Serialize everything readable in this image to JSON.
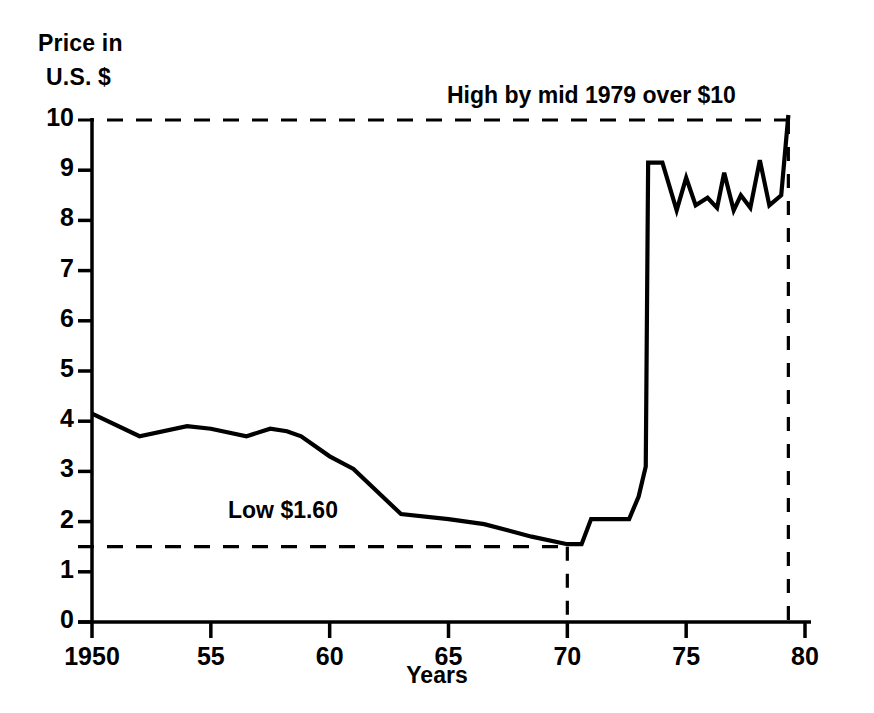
{
  "chart_data": {
    "type": "line",
    "title": "",
    "subtitle": "",
    "xlabel": "Years",
    "ylabel": "Price in U.S. $",
    "ylabel_lines": [
      "Price in",
      "U.S. $"
    ],
    "xlim": [
      1950,
      1980
    ],
    "ylim": [
      0,
      10
    ],
    "grid": false,
    "legend": null,
    "y_ticks": [
      10,
      9,
      8,
      7,
      6,
      5,
      4,
      3,
      2,
      1,
      0
    ],
    "y_tick_labels": [
      "10",
      "9",
      "8",
      "7",
      "6",
      "5",
      "4",
      "3",
      "2",
      "1",
      "0"
    ],
    "x_ticks": [
      1950,
      1955,
      1960,
      1965,
      1970,
      1975,
      1980
    ],
    "x_tick_labels": [
      "1950",
      "55",
      "60",
      "65",
      "70",
      "75",
      "80"
    ],
    "series": [
      {
        "name": "Price in U.S. $",
        "x": [
          1950.0,
          1952.0,
          1954.0,
          1955.0,
          1956.5,
          1957.5,
          1958.2,
          1958.8,
          1960.0,
          1961.0,
          1963.0,
          1965.0,
          1966.5,
          1968.5,
          1970.0,
          1970.6,
          1971.0,
          1972.6,
          1973.0,
          1973.3,
          1973.4,
          1974.0,
          1974.6,
          1975.0,
          1975.4,
          1975.9,
          1976.3,
          1976.6,
          1977.0,
          1977.3,
          1977.7,
          1978.1,
          1978.5,
          1979.0,
          1979.3
        ],
        "y": [
          4.15,
          3.7,
          3.9,
          3.85,
          3.7,
          3.85,
          3.8,
          3.7,
          3.3,
          3.05,
          2.15,
          2.05,
          1.95,
          1.7,
          1.55,
          1.55,
          2.05,
          2.05,
          2.5,
          3.1,
          9.15,
          9.15,
          8.2,
          8.85,
          8.3,
          8.45,
          8.25,
          8.95,
          8.2,
          8.5,
          8.25,
          9.2,
          8.3,
          8.5,
          10.1
        ]
      }
    ],
    "annotations": [
      {
        "name": "high-annotation",
        "text": "High by mid 1979 over $10",
        "reference_value": 10,
        "kind": "horizontal-dashed-with-vertical-drop",
        "x_from": 1950,
        "x_to": 1979.3
      },
      {
        "name": "low-annotation",
        "text": "Low $1.60",
        "reference_value": 1.5,
        "kind": "horizontal-dashed-with-vertical-drop",
        "x_from": 1950,
        "x_to": 1970
      }
    ],
    "colors": {
      "line": "#000000",
      "axis": "#000000",
      "background": "#ffffff",
      "text": "#000000"
    }
  }
}
